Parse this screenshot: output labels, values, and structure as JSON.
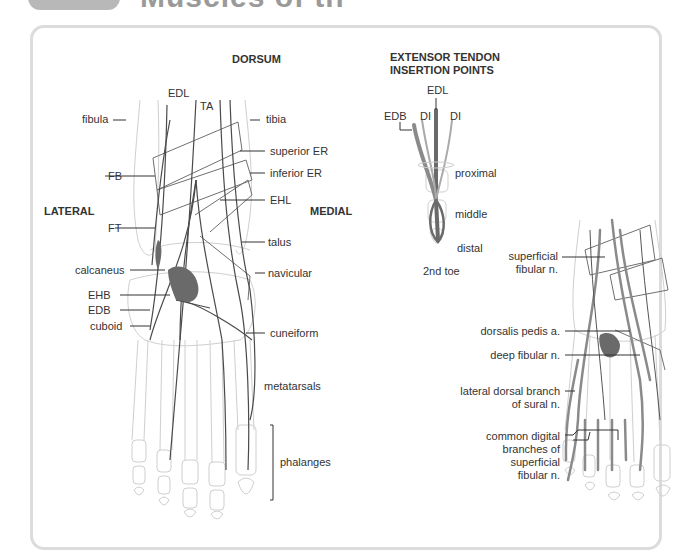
{
  "header": {
    "title": "Muscles of th"
  },
  "main_figure": {
    "heading": "DORSUM",
    "side_lateral": "LATERAL",
    "side_medial": "MEDIAL",
    "labels_left": [
      "fibula",
      "FB",
      "FT",
      "calcaneus",
      "EHB",
      "EDB",
      "cuboid"
    ],
    "labels_top": [
      "EDL",
      "TA"
    ],
    "labels_right": [
      "tibia",
      "superior ER",
      "inferior ER",
      "EHL",
      "talus",
      "navicular",
      "cuneiform",
      "metatarsals",
      "phalanges"
    ]
  },
  "insertion_figure": {
    "heading_line1": "EXTENSOR TENDON",
    "heading_line2": "INSERTION POINTS",
    "labels": {
      "edl": "EDL",
      "edb": "EDB",
      "di_left": "DI",
      "di_right": "DI",
      "proximal": "proximal",
      "middle": "middle",
      "distal": "distal",
      "caption": "2nd toe"
    }
  },
  "nerve_figure": {
    "labels": [
      {
        "line1": "superficial",
        "line2": "fibular n."
      },
      {
        "line1": "dorsalis pedis a."
      },
      {
        "line1": "deep fibular n."
      },
      {
        "line1": "lateral dorsal branch",
        "line2": "of sural n."
      },
      {
        "line1": "common digital",
        "line2": "branches of",
        "line3": "superficial",
        "line4": "fibular n."
      }
    ]
  },
  "colors": {
    "panel_border": "#dcdcdc",
    "tendon": "#555555",
    "bone_outline": "#c8c8c8",
    "muscle_fill": "#6a6a6a",
    "nerve": "#8a8a8a"
  }
}
